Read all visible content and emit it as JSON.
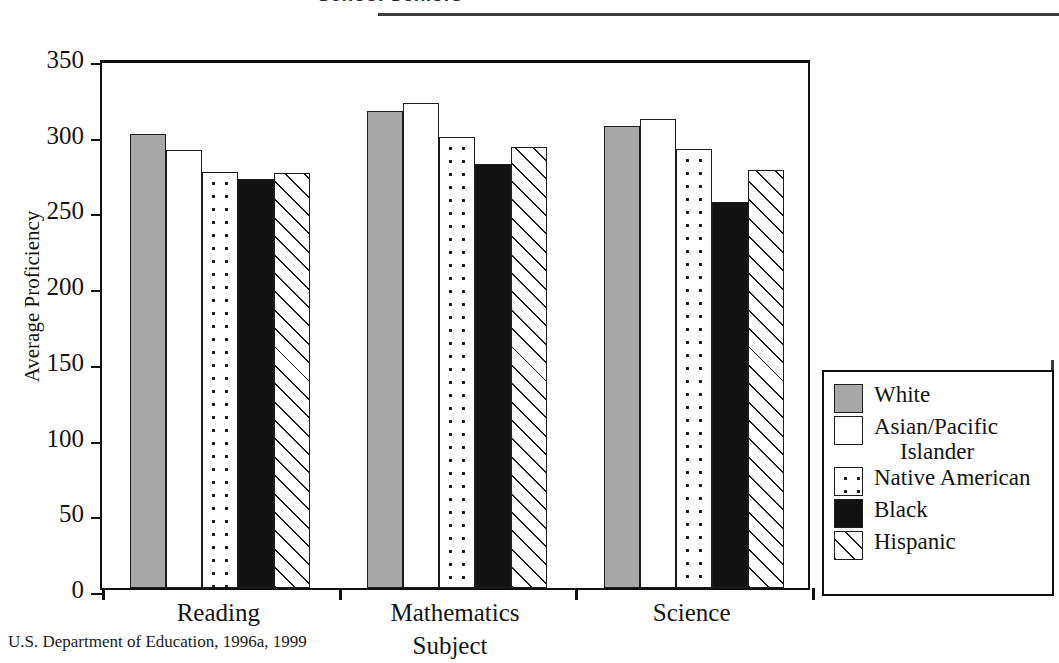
{
  "title": "School Seniors",
  "source_note": "U.S. Department of Education, 1996a, 1999",
  "axes": {
    "y_title": "Average Proficiency",
    "x_title": "Subject"
  },
  "legend": {
    "items": [
      {
        "label": "White",
        "label_cont": "",
        "swatch": "solid-gray-swatch",
        "color": "#a8a8a8"
      },
      {
        "label": "Asian/Pacific",
        "label_cont": "Islander",
        "swatch": "solid-white-swatch",
        "color": "#ffffff"
      },
      {
        "label": "Native American",
        "label_cont": "",
        "swatch": "dotted-swatch",
        "color": "#ffffff"
      },
      {
        "label": "Black",
        "label_cont": "",
        "swatch": "solid-black-swatch",
        "color": "#121212"
      },
      {
        "label": "Hispanic",
        "label_cont": "",
        "swatch": "hatched-swatch",
        "color": "#ffffff"
      }
    ]
  },
  "chart_data": {
    "type": "bar",
    "title": "School Seniors",
    "xlabel": "Subject",
    "ylabel": "Average Proficiency",
    "ylim": [
      0,
      350
    ],
    "yticks": [
      0,
      50,
      100,
      150,
      200,
      250,
      300,
      350
    ],
    "ytick_labels": [
      "0",
      "50",
      "100",
      "150",
      "200",
      "250",
      "300",
      "350"
    ],
    "grid": false,
    "legend_position": "right",
    "categories": [
      "Reading",
      "Mathematics",
      "Science"
    ],
    "series": [
      {
        "name": "White",
        "values": [
          300,
          315,
          305
        ],
        "fill": "fill-gray"
      },
      {
        "name": "Asian/Pacific Islander",
        "values": [
          289,
          320,
          310
        ],
        "fill": "fill-white"
      },
      {
        "name": "Native American",
        "values": [
          275,
          298,
          290
        ],
        "fill": "fill-dots"
      },
      {
        "name": "Black",
        "values": [
          270,
          280,
          255
        ],
        "fill": "fill-black"
      },
      {
        "name": "Hispanic",
        "values": [
          274,
          291,
          276
        ],
        "fill": "fill-hatch"
      }
    ]
  }
}
